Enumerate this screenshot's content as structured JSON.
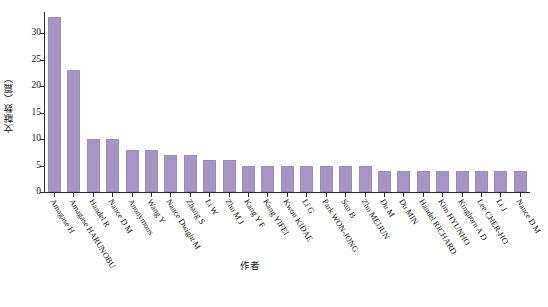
{
  "chart_data": {
    "type": "bar",
    "title": "",
    "xlabel": "作者",
    "ylabel": "文献数（篇）",
    "ylim": [
      0,
      34
    ],
    "yticks": [
      0,
      5,
      10,
      15,
      20,
      25,
      30
    ],
    "ytick_labels": [
      "0",
      "5",
      "10",
      "15",
      "20",
      "25",
      "30"
    ],
    "grid": false,
    "legend": null,
    "bar_color": "#a695c4",
    "categories": [
      "Amagase H",
      "Amagase HARUNOBU",
      "Handel R",
      "Nance D M",
      "Anonymous",
      "Wang Y",
      "Nance Dwight M",
      "Zhang S",
      "Li W",
      "Zhu M J",
      "Kang Y F",
      "Kang YIFEI",
      "Kwon KIDAE",
      "Li G",
      "Park WON-JONG",
      "Sun B",
      "Zhu MEIJUN",
      "Du M",
      "Du MIN",
      "Handel RICHARD",
      "Kim HYUNHO",
      "Kinghorn A D",
      "Lee CHER-HO",
      "Li J",
      "Nance D M"
    ],
    "values": [
      33,
      23,
      10,
      10,
      8,
      8,
      7,
      7,
      6,
      6,
      5,
      5,
      5,
      5,
      5,
      5,
      5,
      4,
      4,
      4,
      4,
      4,
      4,
      4,
      4
    ]
  }
}
